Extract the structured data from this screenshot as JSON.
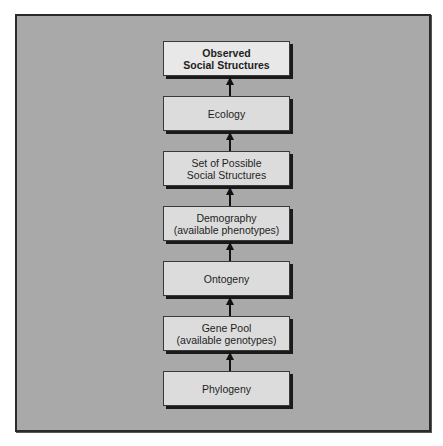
{
  "diagram": {
    "type": "vertical-flow",
    "direction": "bottom-to-top",
    "colors": {
      "frame_background": "#a9a9a9",
      "frame_border": "#2a2a2a",
      "node_fill": "#dcdcdc",
      "top_node_fill": "#e8e8e8",
      "node_shadow": "#1a1a1a",
      "arrow": "#111111",
      "text": "#1e1e1e"
    },
    "nodes": [
      {
        "id": "observed",
        "lines": [
          "Observed",
          "Social Structures"
        ],
        "bold": true
      },
      {
        "id": "ecology",
        "lines": [
          "Ecology"
        ]
      },
      {
        "id": "possible",
        "lines": [
          "Set of Possible",
          "Social Structures"
        ]
      },
      {
        "id": "demography",
        "lines": [
          "Demography",
          "(available phenotypes)"
        ]
      },
      {
        "id": "ontogeny",
        "lines": [
          "Ontogeny"
        ]
      },
      {
        "id": "genepool",
        "lines": [
          "Gene Pool",
          "(available genotypes)"
        ]
      },
      {
        "id": "phylogeny",
        "lines": [
          "Phylogeny"
        ]
      }
    ],
    "edges": [
      {
        "from": "phylogeny",
        "to": "genepool"
      },
      {
        "from": "genepool",
        "to": "ontogeny"
      },
      {
        "from": "ontogeny",
        "to": "demography"
      },
      {
        "from": "demography",
        "to": "possible"
      },
      {
        "from": "possible",
        "to": "ecology"
      },
      {
        "from": "ecology",
        "to": "observed"
      }
    ]
  }
}
